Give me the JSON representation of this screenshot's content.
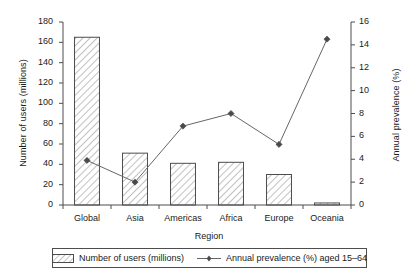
{
  "chart_data": {
    "type": "bar",
    "title": "",
    "categories": [
      "Global",
      "Asia",
      "Americas",
      "Africa",
      "Europe",
      "Oceania"
    ],
    "xlabel": "Region",
    "series": [
      {
        "name": "Number of users (millions)",
        "type": "bar",
        "axis": "left",
        "values": [
          165,
          51,
          41,
          42,
          30,
          2
        ]
      },
      {
        "name": "Annual prevalence (%) aged 15–64",
        "type": "line",
        "axis": "right",
        "values": [
          3.9,
          2.0,
          6.9,
          8.0,
          5.3,
          14.5
        ]
      }
    ],
    "y_left": {
      "label": "Number of users (millions)",
      "min": 0,
      "max": 180,
      "step": 20,
      "ticks": [
        "0",
        "20",
        "40",
        "60",
        "80",
        "100",
        "120",
        "140",
        "160",
        "180"
      ]
    },
    "y_right": {
      "label": "Annual prevalence (%)",
      "min": 0,
      "max": 16,
      "step": 2,
      "ticks": [
        "0",
        "2",
        "4",
        "6",
        "8",
        "10",
        "12",
        "14",
        "16"
      ]
    },
    "grid": false,
    "legend_position": "bottom"
  },
  "legend": {
    "bar_label": "Number of users (millions)",
    "line_label": "Annual prevalence (%) aged 15–64"
  },
  "colors": {
    "axis": "#4d4d4d",
    "bar_outline": "#4d4d4d",
    "bar_hatch": "#8c8c8c",
    "line": "#666666",
    "marker": "#4a4a4a",
    "text": "#1a1a1a",
    "background": "#ffffff"
  }
}
